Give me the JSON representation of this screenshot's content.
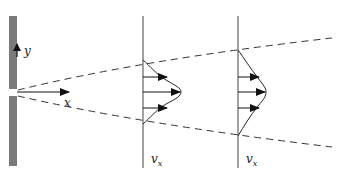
{
  "diagram": {
    "colors": {
      "wall": "#7a7a7a",
      "line": "#222222",
      "dashed": "#333333"
    },
    "axes": {
      "y_label": "y",
      "x_label": "x"
    },
    "profiles": [
      {
        "label_main": "v",
        "label_sub": "x",
        "arrows": 3
      },
      {
        "label_main": "v",
        "label_sub": "x",
        "arrows": 3
      }
    ]
  }
}
